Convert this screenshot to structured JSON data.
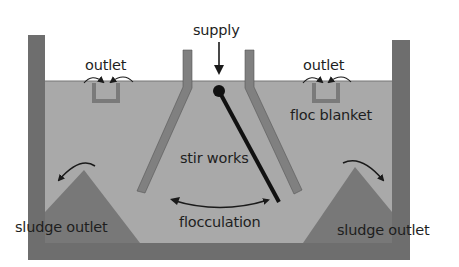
{
  "diagram": {
    "type": "flocculation-clarifier-cross-section",
    "labels": {
      "supply": "supply",
      "outlet_left": "outlet",
      "outlet_right": "outlet",
      "floc_blanket": "floc blanket",
      "stir_works": "stir works",
      "flocculation": "flocculation",
      "sludge_outlet_left": "sludge outlet",
      "sludge_outlet_right": "sludge outlet"
    },
    "colors": {
      "wall": "#6e6e6e",
      "water": "#a9a9a9",
      "hopper": "#7a7a7a",
      "baffle": "#808080",
      "stroke": "#1a1a1a",
      "text": "#1e1e1e"
    }
  }
}
